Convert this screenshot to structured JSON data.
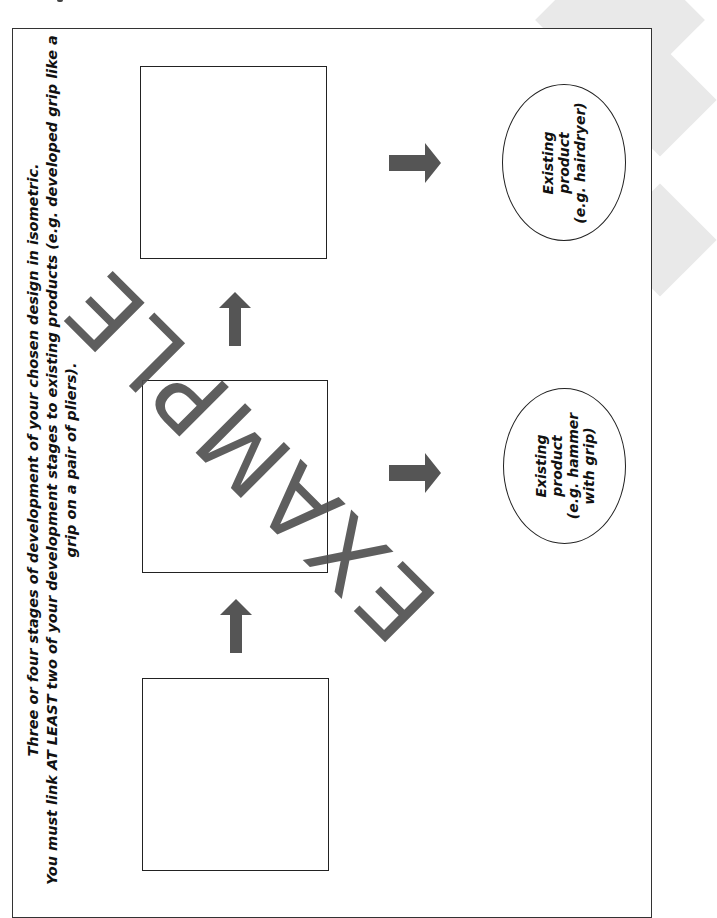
{
  "instructions": {
    "line1": "Three or four stages of development of your chosen design in isometric.",
    "line2": "You must link AT LEAST two of your development stages to existing products (e.g. developed grip like a grip on a pair of pliers)."
  },
  "stages": [
    {
      "label": "Stage 1"
    },
    {
      "label": "Stage 2"
    },
    {
      "label": "Stage 3"
    }
  ],
  "existing_products": [
    {
      "text": "Existing product\n(e.g. hairdryer)"
    },
    {
      "text": "Existing product\n(e.g. hammer\nwith grip)"
    }
  ],
  "watermark": {
    "text": "EXAMPLE"
  },
  "colors": {
    "arrow": "#555555",
    "frame": "#333333",
    "watermark": "#505050",
    "background_shape": "#e9e9e9"
  },
  "icons": {
    "arrow_up": "arrow-up-icon",
    "arrow_right": "arrow-right-icon"
  }
}
